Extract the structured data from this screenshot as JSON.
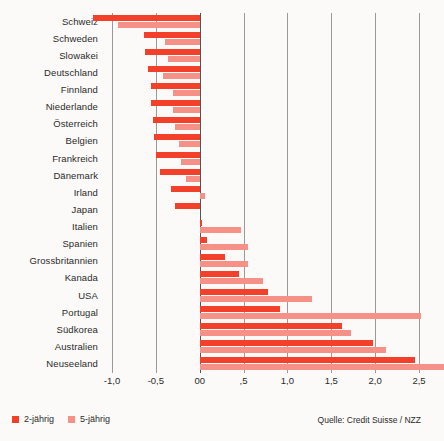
{
  "chart_data": {
    "type": "bar",
    "orientation": "horizontal",
    "title": "",
    "subtitle": "",
    "xlabel": "",
    "ylabel": "",
    "xlim": [
      -1.0,
      2.5
    ],
    "grid": true,
    "grid_axis": "x",
    "legend_position": "bottom-left",
    "source": "Quelle: Credit Suisse / NZZ",
    "xticks": [
      -1.0,
      -0.5,
      0.0,
      0.5,
      1.0,
      1.5,
      2.0,
      2.5
    ],
    "xticklabels": [
      "-1,0",
      "-0,5",
      "00",
      ",5",
      "1,0",
      "1,5",
      "2,0",
      "2,5"
    ],
    "categories": [
      "Schweiz",
      "Schweden",
      "Slowakei",
      "Deutschland",
      "Finnland",
      "Niederlande",
      "Österreich",
      "Belgien",
      "Frankreich",
      "Dänemark",
      "Irland",
      "Japan",
      "Italien",
      "Spanien",
      "Grossbritannien",
      "Kanada",
      "USA",
      "Portugal",
      "Südkorea",
      "Australien",
      "Neuseeland"
    ],
    "series": [
      {
        "name": "2-jährig",
        "color": "#f2402a",
        "values": [
          -1.22,
          -0.64,
          -0.62,
          -0.59,
          -0.56,
          -0.55,
          -0.53,
          -0.52,
          -0.5,
          -0.45,
          -0.33,
          -0.28,
          0.03,
          0.08,
          0.29,
          0.45,
          0.78,
          0.92,
          1.62,
          1.98,
          2.46
        ]
      },
      {
        "name": "5-jährig",
        "color": "#f59186",
        "values": [
          -0.93,
          -0.4,
          -0.36,
          -0.42,
          -0.3,
          -0.3,
          -0.28,
          -0.24,
          -0.21,
          -0.16,
          0.06,
          0.0,
          0.47,
          0.55,
          0.55,
          0.72,
          1.28,
          2.52,
          1.72,
          2.12,
          2.78
        ]
      }
    ]
  },
  "legend": {
    "items": [
      {
        "label": "2-jährig",
        "color": "#f2402a"
      },
      {
        "label": "5-jährig",
        "color": "#f59186"
      }
    ]
  },
  "source": {
    "text": "Quelle: Credit Suisse / NZZ"
  }
}
